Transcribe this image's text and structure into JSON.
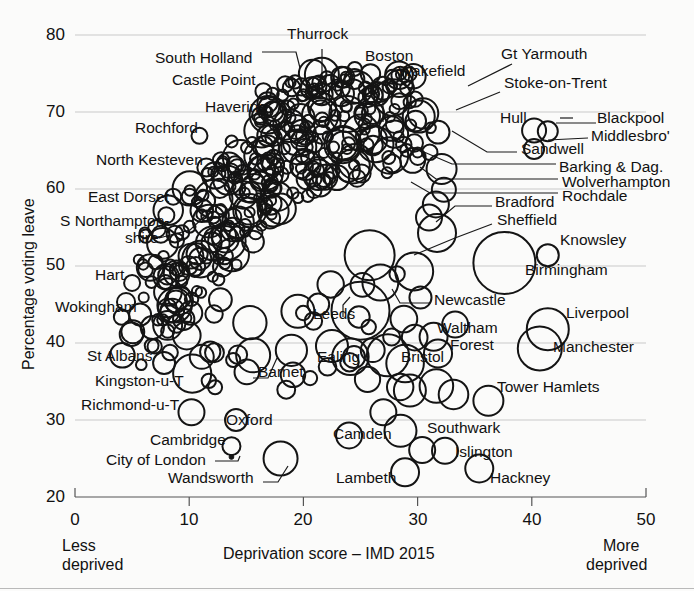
{
  "chart_data": {
    "type": "scatter",
    "title": "",
    "xlabel": "Deprivation score – IMD 2015",
    "ylabel": "Percentage voting leave",
    "xlim": [
      0,
      50
    ],
    "ylim": [
      20,
      80
    ],
    "xticks": [
      0,
      10,
      20,
      30,
      40,
      50
    ],
    "yticks": [
      20,
      30,
      40,
      50,
      60,
      70,
      80
    ],
    "grid": true,
    "legend": "none",
    "marker": "open-circle",
    "size_encoding": "bubble area ≈ electorate size",
    "axis_endcaps": {
      "left_line1": "Less",
      "left_line2": "deprived",
      "right_line1": "More",
      "right_line2": "deprived"
    },
    "labeled_points": [
      {
        "name": "Thurrock",
        "x": 21.6,
        "y": 72.3,
        "r": 11
      },
      {
        "name": "South Holland",
        "x": 18.4,
        "y": 73.6,
        "r": 8
      },
      {
        "name": "Castle Point",
        "x": 16.5,
        "y": 72.7,
        "r": 8
      },
      {
        "name": "Boston",
        "x": 24.5,
        "y": 75.6,
        "r": 7
      },
      {
        "name": "Wakefield",
        "x": 26.1,
        "y": 66.4,
        "r": 14
      },
      {
        "name": "Gt Yarmouth",
        "x": 28.4,
        "y": 71.4,
        "r": 8
      },
      {
        "name": "Stoke-on-Trent",
        "x": 30.1,
        "y": 69.4,
        "r": 16
      },
      {
        "name": "Havering",
        "x": 17.8,
        "y": 69.7,
        "r": 13
      },
      {
        "name": "Hull",
        "x": 40.2,
        "y": 67.6,
        "r": 12
      },
      {
        "name": "Blackpool",
        "x": 41.4,
        "y": 67.5,
        "r": 10
      },
      {
        "name": "Middlesbro'",
        "x": 40.2,
        "y": 65.2,
        "r": 10
      },
      {
        "name": "Rochford",
        "x": 10.9,
        "y": 66.9,
        "r": 8
      },
      {
        "name": "North Kesteven",
        "x": 11.5,
        "y": 62.8,
        "r": 9
      },
      {
        "name": "Sandwell",
        "x": 32.1,
        "y": 62.6,
        "r": 15
      },
      {
        "name": "Barking & Dag.",
        "x": 32.3,
        "y": 59.9,
        "r": 12
      },
      {
        "name": "Wolverhampton",
        "x": 31.6,
        "y": 58.0,
        "r": 13
      },
      {
        "name": "Rochdale",
        "x": 31.0,
        "y": 56.3,
        "r": 13
      },
      {
        "name": "East Dorset",
        "x": 8.6,
        "y": 59.0,
        "r": 8
      },
      {
        "name": "S Northamptonshire",
        "x": 8.0,
        "y": 56.6,
        "r": 8
      },
      {
        "name": "Bradford",
        "x": 31.7,
        "y": 54.3,
        "r": 19
      },
      {
        "name": "Sheffield",
        "x": 25.8,
        "y": 51.4,
        "r": 25
      },
      {
        "name": "Birmingham",
        "x": 37.6,
        "y": 50.4,
        "r": 31
      },
      {
        "name": "Knowsley",
        "x": 41.4,
        "y": 51.4,
        "r": 11
      },
      {
        "name": "Hart",
        "x": 5.0,
        "y": 47.8,
        "r": 8
      },
      {
        "name": "Wokingham",
        "x": 5.7,
        "y": 43.7,
        "r": 11
      },
      {
        "name": "Newcastle",
        "x": 29.7,
        "y": 49.3,
        "r": 19
      },
      {
        "name": "Leeds",
        "x": 25.0,
        "y": 44.2,
        "r": 29
      },
      {
        "name": "Waltham Forest",
        "x": 31.4,
        "y": 40.8,
        "r": 14
      },
      {
        "name": "Bristol",
        "x": 27.4,
        "y": 38.4,
        "r": 21
      },
      {
        "name": "Ealing",
        "x": 22.5,
        "y": 39.6,
        "r": 16
      },
      {
        "name": "Barnet",
        "x": 15.6,
        "y": 38.4,
        "r": 17
      },
      {
        "name": "Liverpool",
        "x": 41.4,
        "y": 41.8,
        "r": 21
      },
      {
        "name": "Manchester",
        "x": 40.7,
        "y": 39.3,
        "r": 22
      },
      {
        "name": "St Albans",
        "x": 7.8,
        "y": 37.4,
        "r": 11
      },
      {
        "name": "Kingston-u-T",
        "x": 11.1,
        "y": 38.2,
        "r": 12
      },
      {
        "name": "Richmond-u-T",
        "x": 10.2,
        "y": 31.0,
        "r": 13
      },
      {
        "name": "Oxford",
        "x": 14.1,
        "y": 30.0,
        "r": 11
      },
      {
        "name": "Tower Hamlets",
        "x": 36.2,
        "y": 32.5,
        "r": 15
      },
      {
        "name": "Camden",
        "x": 24.0,
        "y": 28.0,
        "r": 13
      },
      {
        "name": "Southwark",
        "x": 28.5,
        "y": 28.6,
        "r": 16
      },
      {
        "name": "Southwark_upper",
        "x": 27.0,
        "y": 31.0,
        "r": 13
      },
      {
        "name": "Islington",
        "x": 30.4,
        "y": 26.1,
        "r": 13
      },
      {
        "name": "Islington_right",
        "x": 32.4,
        "y": 26.0,
        "r": 13
      },
      {
        "name": "Hackney",
        "x": 35.4,
        "y": 23.7,
        "r": 14
      },
      {
        "name": "Lambeth",
        "x": 28.9,
        "y": 23.2,
        "r": 14
      },
      {
        "name": "Cambridge",
        "x": 13.7,
        "y": 26.6,
        "r": 9
      },
      {
        "name": "City of London",
        "x": 13.7,
        "y": 25.2,
        "r": 2
      },
      {
        "name": "Wandsworth",
        "x": 18.0,
        "y": 25.0,
        "r": 17
      }
    ],
    "callout_labels": [
      {
        "text": "Thurrock",
        "tx": 287,
        "ty": 34,
        "anchor": "start"
      },
      {
        "text": "South Holland",
        "tx": 155,
        "ty": 58,
        "anchor": "start"
      },
      {
        "text": "Castle Point",
        "tx": 172,
        "ty": 80,
        "anchor": "start"
      },
      {
        "text": "Boston",
        "tx": 365,
        "ty": 56,
        "anchor": "start"
      },
      {
        "text": "Wakefield",
        "tx": 398,
        "ty": 71,
        "anchor": "start"
      },
      {
        "text": "Gt Yarmouth",
        "tx": 501,
        "ty": 54,
        "anchor": "start"
      },
      {
        "text": "Stoke-on-Trent",
        "tx": 504,
        "ty": 83,
        "anchor": "start"
      },
      {
        "text": "Havering",
        "tx": 205,
        "ty": 107,
        "anchor": "start"
      },
      {
        "text": "Hull",
        "tx": 500,
        "ty": 118,
        "anchor": "start"
      },
      {
        "text": "Blackpool",
        "tx": 597,
        "ty": 118,
        "anchor": "start"
      },
      {
        "text": "Middlesbro'",
        "tx": 591,
        "ty": 136,
        "anchor": "start"
      },
      {
        "text": "Rochford",
        "tx": 135,
        "ty": 128,
        "anchor": "start"
      },
      {
        "text": "North Kesteven",
        "tx": 96,
        "ty": 160,
        "anchor": "start"
      },
      {
        "text": "Sandwell",
        "tx": 521,
        "ty": 149,
        "anchor": "start"
      },
      {
        "text": "Barking & Dag.",
        "tx": 559,
        "ty": 167,
        "anchor": "start"
      },
      {
        "text": "Wolverhampton",
        "tx": 562,
        "ty": 182,
        "anchor": "start"
      },
      {
        "text": "Rochdale",
        "tx": 562,
        "ty": 196,
        "anchor": "start"
      },
      {
        "text": "East Dorset",
        "tx": 88,
        "ty": 197,
        "anchor": "start"
      },
      {
        "text": "S Northampton-",
        "tx": 60,
        "ty": 221,
        "anchor": "start"
      },
      {
        "text": "shire",
        "tx": 125,
        "ty": 238,
        "anchor": "start"
      },
      {
        "text": "Bradford",
        "tx": 495,
        "ty": 202,
        "anchor": "start"
      },
      {
        "text": "Sheffield",
        "tx": 497,
        "ty": 220,
        "anchor": "start"
      },
      {
        "text": "Knowsley",
        "tx": 560,
        "ty": 240,
        "anchor": "start"
      },
      {
        "text": "Birmingham",
        "tx": 525,
        "ty": 270,
        "anchor": "start"
      },
      {
        "text": "Hart",
        "tx": 95,
        "ty": 275,
        "anchor": "start"
      },
      {
        "text": "Wokingham",
        "tx": 55,
        "ty": 307,
        "anchor": "start"
      },
      {
        "text": "Newcastle",
        "tx": 434,
        "ty": 300,
        "anchor": "start"
      },
      {
        "text": "Leeds",
        "tx": 313,
        "ty": 314,
        "anchor": "start"
      },
      {
        "text": "Waltham",
        "tx": 437,
        "ty": 328,
        "anchor": "start"
      },
      {
        "text": "Forest",
        "tx": 450,
        "ty": 345,
        "anchor": "start"
      },
      {
        "text": "Liverpool",
        "tx": 566,
        "ty": 313,
        "anchor": "start"
      },
      {
        "text": "Manchester",
        "tx": 553,
        "ty": 347,
        "anchor": "start"
      },
      {
        "text": "Ealing",
        "tx": 317,
        "ty": 357,
        "anchor": "start"
      },
      {
        "text": "Bristol",
        "tx": 401,
        "ty": 357,
        "anchor": "start"
      },
      {
        "text": "Barnet",
        "tx": 258,
        "ty": 372,
        "anchor": "start"
      },
      {
        "text": "St Albans",
        "tx": 87,
        "ty": 356,
        "anchor": "start"
      },
      {
        "text": "Kingston-u-T",
        "tx": 95,
        "ty": 381,
        "anchor": "start"
      },
      {
        "text": "Richmond-u-T",
        "tx": 81,
        "ty": 405,
        "anchor": "start"
      },
      {
        "text": "Oxford",
        "tx": 226,
        "ty": 420,
        "anchor": "start"
      },
      {
        "text": "Tower Hamlets",
        "tx": 497,
        "ty": 387,
        "anchor": "start"
      },
      {
        "text": "Camden",
        "tx": 333,
        "ty": 434,
        "anchor": "start"
      },
      {
        "text": "Southwark",
        "tx": 427,
        "ty": 428,
        "anchor": "start"
      },
      {
        "text": "Islington",
        "tx": 455,
        "ty": 452,
        "anchor": "start"
      },
      {
        "text": "Cambridge",
        "tx": 150,
        "ty": 440,
        "anchor": "start"
      },
      {
        "text": "City of London",
        "tx": 106,
        "ty": 460,
        "anchor": "start"
      },
      {
        "text": "Wandsworth",
        "tx": 168,
        "ty": 478,
        "anchor": "start"
      },
      {
        "text": "Lambeth",
        "tx": 336,
        "ty": 478,
        "anchor": "start"
      },
      {
        "text": "Hackney",
        "tx": 490,
        "ty": 478,
        "anchor": "start"
      }
    ]
  },
  "axes": {
    "y_ticks": [
      "80",
      "70",
      "60",
      "50",
      "40",
      "30",
      "20"
    ],
    "x_ticks": [
      "0",
      "10",
      "20",
      "30",
      "40",
      "50"
    ],
    "y_title": "Percentage voting leave",
    "x_title": "Deprivation score – IMD 2015",
    "left_cap_1": "Less",
    "left_cap_2": "deprived",
    "right_cap_1": "More",
    "right_cap_2": "deprived"
  },
  "colors": {
    "marker_stroke": "#141414",
    "grid": "#c9c9c9",
    "axis": "#555555",
    "text": "#111111",
    "background": "#fbfbfa"
  }
}
